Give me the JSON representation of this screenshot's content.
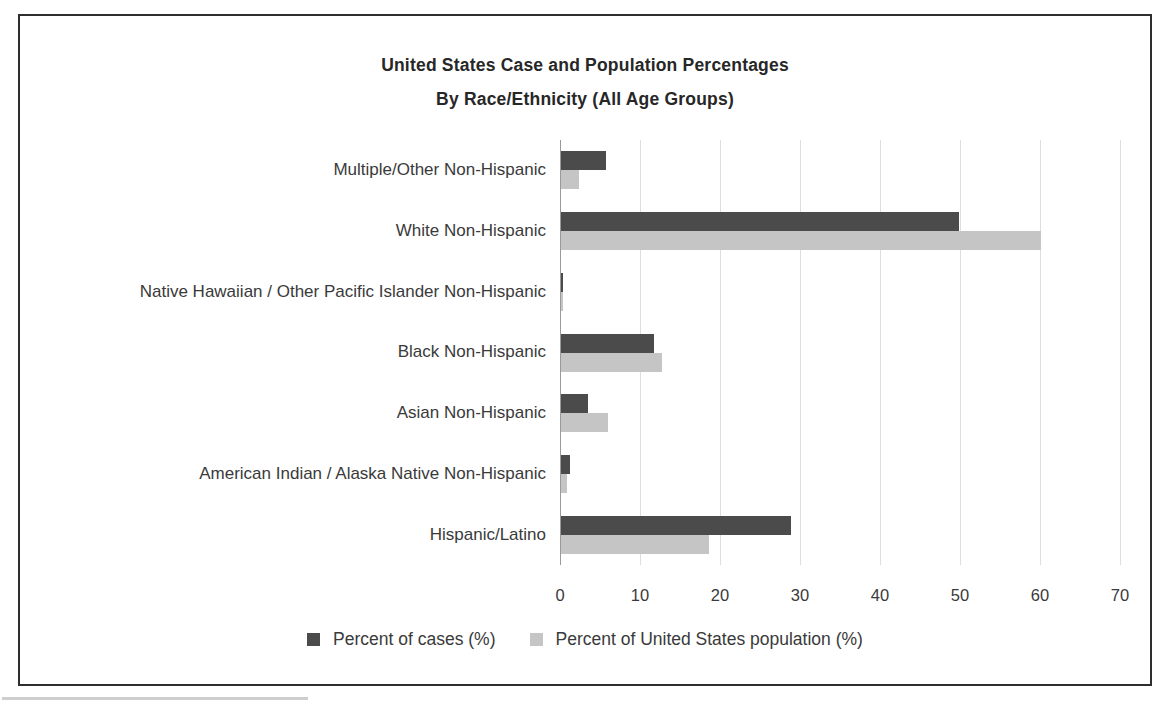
{
  "figure": {
    "title_line1": "United States Case and Population Percentages",
    "title_line2": "By Race/Ethnicity (All Age Groups)"
  },
  "chart_data": {
    "type": "bar",
    "orientation": "horizontal",
    "title": "United States Case and Population Percentages By Race/Ethnicity (All Age Groups)",
    "categories": [
      "Multiple/Other Non-Hispanic",
      "White Non-Hispanic",
      "Native Hawaiian / Other Pacific Islander Non-Hispanic",
      "Black Non-Hispanic",
      "Asian Non-Hispanic",
      "American Indian / Alaska Native Non-Hispanic",
      "Hispanic/Latino"
    ],
    "series": [
      {
        "name": "Percent of cases (%)",
        "color": "#4b4b4b",
        "values": [
          5.6,
          49.7,
          0.3,
          11.6,
          3.4,
          1.1,
          28.8
        ]
      },
      {
        "name": "Percent of United States population (%)",
        "color": "#c5c5c5",
        "values": [
          2.3,
          60.0,
          0.2,
          12.6,
          5.9,
          0.8,
          18.5
        ]
      }
    ],
    "xlabel": "",
    "ylabel": "",
    "xlim": [
      0,
      70
    ],
    "xticks": [
      0,
      10,
      20,
      30,
      40,
      50,
      60,
      70
    ],
    "grid": "vertical",
    "legend_position": "bottom-center"
  }
}
